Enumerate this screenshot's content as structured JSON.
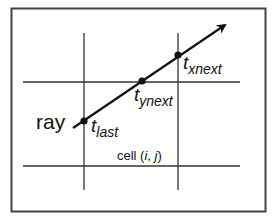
{
  "diagram": {
    "type": "grid-traversal",
    "colors": {
      "background": "#ffffff",
      "frame": "#444444",
      "grid": "#333333",
      "ray": "#111111",
      "point": "#111111"
    },
    "labels": {
      "ray": "ray",
      "t_last": {
        "main": "t",
        "sub": "last"
      },
      "t_ynext": {
        "main": "t",
        "sub": "ynext"
      },
      "t_xnext": {
        "main": "t",
        "sub": "xnext"
      },
      "cell": {
        "prefix": "cell (",
        "i": "i",
        "sep": ", ",
        "j": "j",
        "suffix": ")"
      }
    },
    "points": [
      {
        "name": "t_last",
        "x": 84,
        "y": 121
      },
      {
        "name": "t_ynext",
        "x": 142,
        "y": 81
      },
      {
        "name": "t_xnext",
        "x": 178,
        "y": 55
      }
    ]
  }
}
